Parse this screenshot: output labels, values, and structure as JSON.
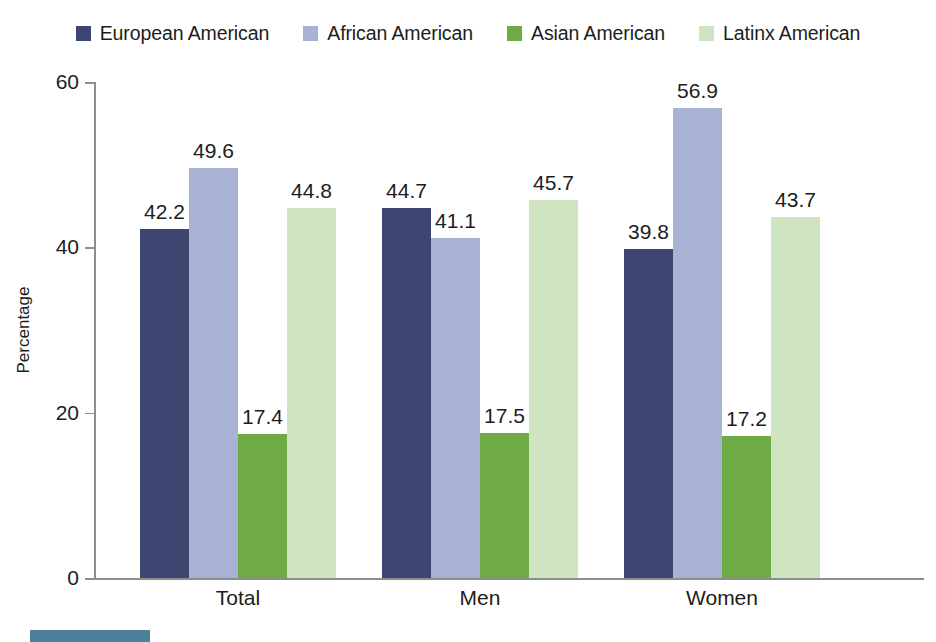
{
  "legend": {
    "items": [
      {
        "label": "European American",
        "color": "#3c4670",
        "icon": "square-swatch-icon"
      },
      {
        "label": "African American",
        "color": "#a8b2d4",
        "icon": "square-swatch-icon"
      },
      {
        "label": "Asian American",
        "color": "#6fab44",
        "icon": "square-swatch-icon"
      },
      {
        "label": "Latinx American",
        "color": "#cfe5c2",
        "icon": "square-swatch-icon"
      }
    ]
  },
  "axes": {
    "y_title": "Percentage",
    "y_ticks": [
      "0",
      "20",
      "40",
      "60"
    ],
    "x_labels": [
      "Total",
      "Men",
      "Women"
    ]
  },
  "accent": {
    "color": "#4d7f99"
  },
  "chart_data": {
    "type": "bar",
    "title": "",
    "xlabel": "",
    "ylabel": "Percentage",
    "ylim": [
      0,
      60
    ],
    "yticks": [
      0,
      20,
      40,
      60
    ],
    "grid": false,
    "legend_position": "top-center",
    "categories": [
      "Total",
      "Men",
      "Women"
    ],
    "series": [
      {
        "name": "European American",
        "color": "#3c4670",
        "values": [
          42.2,
          44.7,
          39.8
        ],
        "labels": [
          "42.2",
          "44.7",
          "39.8"
        ]
      },
      {
        "name": "African American",
        "color": "#a8b2d4",
        "values": [
          49.6,
          41.1,
          56.9
        ],
        "labels": [
          "49.6",
          "41.1",
          "56.9"
        ]
      },
      {
        "name": "Asian American",
        "color": "#6fab44",
        "values": [
          17.4,
          17.5,
          17.2
        ],
        "labels": [
          "17.4",
          "17.5",
          "17.2"
        ]
      },
      {
        "name": "Latinx American",
        "color": "#cfe5c2",
        "values": [
          44.8,
          45.7,
          43.7
        ],
        "labels": [
          "44.8",
          "45.7",
          "43.7"
        ]
      }
    ]
  }
}
